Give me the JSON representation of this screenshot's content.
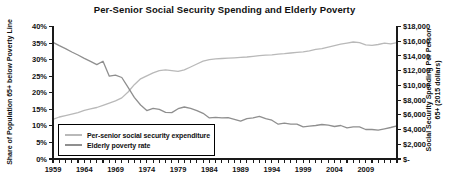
{
  "window": {
    "width": 449,
    "height": 182,
    "background": "#ffffff"
  },
  "colors": {
    "axis": "#1a1a1a",
    "text": "#111111",
    "expenditure_line": "#b9b9b9",
    "poverty_line": "#8f8f8f",
    "legend_border": "#000000"
  },
  "chart_data": {
    "type": "line",
    "title": "Per-Senior Social Security Spending and Elderly Poverty",
    "x_years": [
      1959,
      1960,
      1961,
      1962,
      1963,
      1964,
      1965,
      1966,
      1967,
      1968,
      1969,
      1970,
      1971,
      1972,
      1973,
      1974,
      1975,
      1976,
      1977,
      1978,
      1979,
      1980,
      1981,
      1982,
      1983,
      1984,
      1985,
      1986,
      1987,
      1988,
      1989,
      1990,
      1991,
      1992,
      1993,
      1994,
      1995,
      1996,
      1997,
      1998,
      1999,
      2000,
      2001,
      2002,
      2003,
      2004,
      2005,
      2006,
      2007,
      2008,
      2009,
      2010,
      2011,
      2012,
      2013,
      2014
    ],
    "x_axis": {
      "min": 1959,
      "max": 2014,
      "tick_every_years": 1,
      "label_every_years": 5,
      "labels": [
        "1959",
        "1964",
        "1969",
        "1974",
        "1979",
        "1984",
        "1989",
        "1994",
        "1999",
        "2004",
        "2009"
      ]
    },
    "left_axis": {
      "label": "Share of Population 65+ below Poverty Line",
      "min": 0,
      "max": 40,
      "step": 5,
      "tick_labels": [
        "0%",
        "5%",
        "10%",
        "15%",
        "20%",
        "25%",
        "30%",
        "35%",
        "40%"
      ]
    },
    "right_axis": {
      "label_line1": "Social Security Spending Per Person",
      "label_line2": "65+ (2015 dollars)",
      "min": 0,
      "max": 18000,
      "step": 2000,
      "tick_labels": [
        "$-",
        "$2,000",
        "$4,000",
        "$6,000",
        "$8,000",
        "$10,000",
        "$12,000",
        "$14,000",
        "$16,000",
        "$18,000"
      ]
    },
    "legend": {
      "position": "bottom-left"
    },
    "series": [
      {
        "name": "Per-senior social security expenditure",
        "axis": "right",
        "color": "#b9b9b9",
        "values": [
          5400,
          5700,
          5900,
          6100,
          6300,
          6600,
          6800,
          7000,
          7300,
          7600,
          7900,
          8300,
          9100,
          10100,
          10900,
          11300,
          11700,
          12000,
          12100,
          12000,
          11900,
          12100,
          12500,
          12900,
          13300,
          13500,
          13600,
          13650,
          13700,
          13750,
          13800,
          13850,
          13950,
          14050,
          14100,
          14150,
          14250,
          14300,
          14400,
          14500,
          14550,
          14700,
          14900,
          15000,
          15200,
          15400,
          15600,
          15750,
          15900,
          15800,
          15500,
          15450,
          15550,
          15750,
          15650,
          15800
        ]
      },
      {
        "name": "Elderly poverty rate",
        "axis": "left",
        "color": "#8f8f8f",
        "values": [
          35.2,
          34.2,
          33.3,
          32.3,
          31.4,
          30.4,
          29.5,
          28.5,
          29.5,
          25.0,
          25.3,
          24.6,
          21.6,
          18.6,
          16.3,
          14.6,
          15.3,
          15.0,
          14.1,
          14.0,
          15.2,
          15.7,
          15.3,
          14.6,
          13.8,
          12.4,
          12.6,
          12.4,
          12.5,
          12.0,
          11.4,
          12.2,
          12.4,
          12.9,
          12.2,
          11.7,
          10.5,
          10.8,
          10.5,
          10.5,
          9.7,
          9.9,
          10.1,
          10.4,
          10.2,
          9.8,
          10.1,
          9.4,
          9.7,
          9.7,
          8.9,
          8.9,
          8.7,
          9.1,
          9.5,
          10.0
        ]
      }
    ]
  }
}
